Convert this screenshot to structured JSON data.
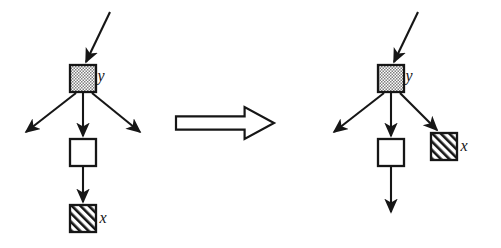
{
  "figure": {
    "type": "graph-rewrite-rule",
    "title": "",
    "background_color": "#ffffff",
    "stroke_color": "#161616",
    "node_fill_white": "#ffffff",
    "node_fill_stippled": "#c9c9c9",
    "node_fill_hatched": "#ffffff",
    "hatch_color": "#161616",
    "labels": {
      "y": "y",
      "x": "x"
    }
  },
  "left_graph": {
    "name": "before",
    "nodes": [
      {
        "id": "y-left",
        "label": "y",
        "fill_style": "stippled",
        "x": 70,
        "y": 65,
        "width": 26,
        "height": 27,
        "label_x": 101,
        "label_y": 81
      },
      {
        "id": "mid-left",
        "label": "",
        "fill_style": "white",
        "x": 70,
        "y": 139,
        "width": 26,
        "height": 27,
        "label_x": 0,
        "label_y": 0
      },
      {
        "id": "x-left",
        "label": "x",
        "fill_style": "hatched",
        "x": 70,
        "y": 205,
        "width": 26,
        "height": 27,
        "label_x": 103,
        "label_y": 223
      }
    ],
    "edges": [
      {
        "id": "in-y-left",
        "kind": "incoming",
        "x1": 110,
        "y1": 12,
        "x2": 86,
        "y2": 62
      },
      {
        "id": "y-left-to-sw",
        "kind": "dangling",
        "x1": 76,
        "y1": 93,
        "x2": 26,
        "y2": 132
      },
      {
        "id": "y-left-to-mid",
        "kind": "tree",
        "x1": 83,
        "y1": 93,
        "x2": 83,
        "y2": 136
      },
      {
        "id": "y-left-to-se",
        "kind": "dangling",
        "x1": 92,
        "y1": 93,
        "x2": 140,
        "y2": 132
      },
      {
        "id": "mid-to-x-left",
        "kind": "tree",
        "x1": 83,
        "y1": 167,
        "x2": 83,
        "y2": 202
      }
    ]
  },
  "transform_arrow": {
    "name": "implies-arrow",
    "symbol": "double-right-arrow",
    "x": 176,
    "y": 107,
    "width": 98,
    "height": 32
  },
  "right_graph": {
    "name": "after",
    "nodes": [
      {
        "id": "y-right",
        "label": "y",
        "fill_style": "stippled",
        "x": 378,
        "y": 65,
        "width": 26,
        "height": 27,
        "label_x": 409,
        "label_y": 81
      },
      {
        "id": "mid-right",
        "label": "",
        "fill_style": "white",
        "x": 378,
        "y": 139,
        "width": 26,
        "height": 27,
        "label_x": 0,
        "label_y": 0
      },
      {
        "id": "x-right",
        "label": "x",
        "fill_style": "hatched",
        "x": 431,
        "y": 133,
        "width": 26,
        "height": 27,
        "label_x": 464,
        "label_y": 151
      }
    ],
    "edges": [
      {
        "id": "in-y-right",
        "kind": "incoming",
        "x1": 418,
        "y1": 12,
        "x2": 394,
        "y2": 62
      },
      {
        "id": "y-right-to-sw",
        "kind": "dangling",
        "x1": 384,
        "y1": 93,
        "x2": 334,
        "y2": 132
      },
      {
        "id": "y-right-to-mid",
        "kind": "tree",
        "x1": 391,
        "y1": 93,
        "x2": 391,
        "y2": 136
      },
      {
        "id": "y-right-to-x",
        "kind": "tree",
        "x1": 400,
        "y1": 93,
        "x2": 437,
        "y2": 130
      },
      {
        "id": "mid-right-dangling",
        "kind": "dangling",
        "x1": 391,
        "y1": 167,
        "x2": 391,
        "y2": 212
      }
    ]
  }
}
